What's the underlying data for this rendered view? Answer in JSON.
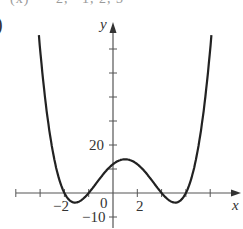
{
  "header": {
    "clipped_text": "(x) = −2, −1, 2, 3",
    "part_label": ")"
  },
  "axes": {
    "x_label": "x",
    "y_label": "y",
    "tick_labels": {
      "x_neg2": "−2",
      "origin": "0",
      "x_2": "2",
      "y_20": "20",
      "y_neg10": "−10"
    }
  },
  "chart_data": {
    "type": "line",
    "title": "",
    "xlabel": "x",
    "ylabel": "y",
    "function": "f(x) = (x+2)(x+1)(x-2)(x-3)",
    "roots": [
      -2,
      -1,
      2,
      3
    ],
    "y_intercept": 12,
    "x_ticks": [
      -4,
      -3,
      -2,
      -1,
      1,
      2,
      3,
      4
    ],
    "x_tick_labels": {
      "-2": "−2",
      "2": "2"
    },
    "y_ticks": [
      -10,
      10,
      20,
      30,
      40,
      50,
      60
    ],
    "y_tick_labels": {
      "20": "20",
      "-10": "−10"
    },
    "origin_label": "0",
    "xlim": [
      -4,
      5
    ],
    "ylim": [
      -12,
      70
    ],
    "grid": false,
    "series": [
      {
        "name": "f(x)",
        "x": [
          -3.05,
          -2.5,
          -2,
          -1.5,
          -1,
          -0.5,
          0,
          0.5,
          1,
          1.5,
          2,
          2.5,
          3,
          3.5,
          4.05
        ],
        "y": [
          68,
          14.6,
          0,
          -3.9,
          0,
          10.3,
          12,
          15.2,
          12,
          6.4,
          0,
          -4.3,
          0,
          16.9,
          68
        ]
      }
    ]
  }
}
